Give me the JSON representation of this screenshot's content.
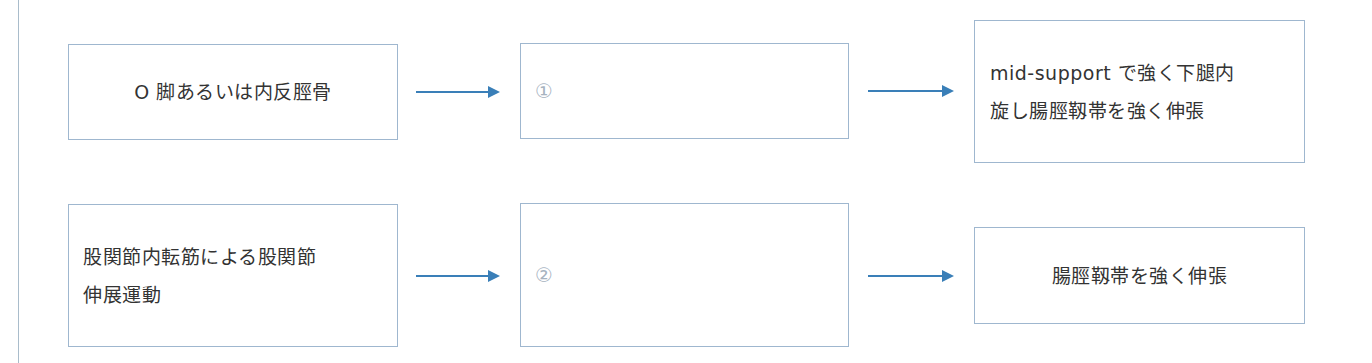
{
  "diagram": {
    "colors": {
      "box_border": "#9fb7cf",
      "arrow": "#3a7fb8",
      "text": "#333333",
      "placeholder_number": "#a7b3bf"
    },
    "rows": [
      {
        "cause": "O 脚あるいは内反脛骨",
        "blank": "①",
        "result": "mid-support で強く下腿内\n旋し腸脛靱帯を強く伸張"
      },
      {
        "cause": "股関節内転筋による股関節\n伸展運動",
        "blank": "②",
        "result": "腸脛靱帯を強く伸張"
      }
    ]
  }
}
